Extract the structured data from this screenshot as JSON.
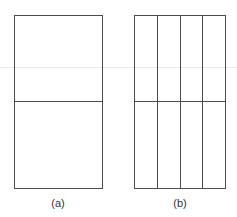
{
  "figure": {
    "panels": [
      {
        "id": "a",
        "label": "(a)",
        "rows": 2,
        "columns": 1,
        "description": "rectangle split horizontally into two equal halves"
      },
      {
        "id": "b",
        "label": "(b)",
        "rows": 2,
        "columns": 4,
        "description": "rectangle split horizontally into two halves and vertically into four equal columns"
      }
    ],
    "colors": {
      "stroke": "#4a4a4a",
      "background": "#ffffff",
      "label": "#333333"
    }
  }
}
